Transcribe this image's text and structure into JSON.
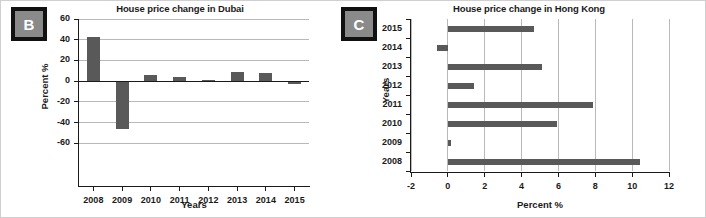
{
  "figure": {
    "panels": [
      {
        "key": "B",
        "label": "B"
      },
      {
        "key": "C",
        "label": "C"
      }
    ],
    "accent_bar_color": "#595959",
    "gridline_color": "#b9b9b9",
    "axis_color": "#1a1a1a",
    "badge_border_color": "#111111",
    "badge_fill_color": "#8a8a8a"
  },
  "chart_data": [
    {
      "panel": "B",
      "type": "bar",
      "orientation": "vertical",
      "title": "House price change in Dubai",
      "xlabel": "Years",
      "ylabel": "Percent %",
      "categories": [
        "2008",
        "2009",
        "2010",
        "2011",
        "2012",
        "2013",
        "2014",
        "2015"
      ],
      "values": [
        43,
        -46.5,
        5.5,
        4,
        1,
        9,
        8,
        -3
      ],
      "ylim": [
        -80,
        60
      ],
      "yticks": [
        60,
        40,
        20,
        0,
        -20,
        -40,
        -60
      ],
      "ytick_labels": [
        "60",
        "40",
        "20",
        "0",
        "-20",
        "-40",
        "-60"
      ],
      "grid": "horizontal",
      "legend": "none"
    },
    {
      "panel": "C",
      "type": "bar",
      "orientation": "horizontal",
      "title": "House price change in Hong Kong",
      "xlabel": "Percent %",
      "ylabel": "Years",
      "categories": [
        "2015",
        "2014",
        "2013",
        "2012",
        "2011",
        "2010",
        "2009",
        "2008"
      ],
      "values": [
        4.7,
        -0.6,
        5.1,
        1.4,
        7.9,
        5.9,
        0.15,
        10.4
      ],
      "xlim": [
        -2,
        12
      ],
      "xticks": [
        -2,
        0,
        2,
        4,
        6,
        8,
        10,
        12
      ],
      "xtick_labels": [
        "-2",
        "0",
        "2",
        "4",
        "6",
        "8",
        "10",
        "12"
      ],
      "grid": "vertical",
      "legend": "none"
    }
  ]
}
